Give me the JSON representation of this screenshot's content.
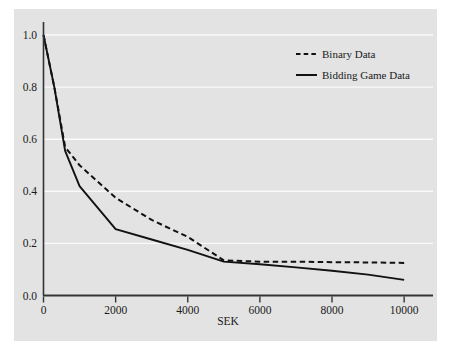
{
  "chart_data": {
    "type": "line",
    "title": "",
    "subtitle": "",
    "xlabel": "SEK",
    "ylabel": "",
    "xlim": [
      0,
      10800
    ],
    "ylim": [
      0.0,
      1.05
    ],
    "xticks": [
      0,
      2000,
      4000,
      6000,
      8000,
      10000
    ],
    "xticklabels": [
      "0",
      "2000",
      "4000",
      "6000",
      "8000",
      "10000"
    ],
    "yticks": [
      0.0,
      0.2,
      0.4,
      0.6,
      0.8,
      1.0
    ],
    "yticklabels": [
      "0.0",
      "0.2",
      "0.4",
      "0.6",
      "0.8",
      "1.0"
    ],
    "grid": "horizontal",
    "grid_color": "#fafafa",
    "panel_color": "#e3e3e3",
    "axis_color": "#333333",
    "legend_position": "top-right",
    "series": [
      {
        "name": "Binary Data",
        "style": "dashed",
        "color": "#111111",
        "x": [
          0,
          300,
          600,
          1000,
          2000,
          3000,
          4000,
          5000,
          6000,
          7000,
          8000,
          9000,
          10000
        ],
        "values": [
          1.0,
          0.8,
          0.57,
          0.5,
          0.375,
          0.29,
          0.225,
          0.135,
          0.13,
          0.13,
          0.128,
          0.127,
          0.125
        ]
      },
      {
        "name": "Bidding Game Data",
        "style": "solid",
        "color": "#111111",
        "x": [
          0,
          300,
          600,
          1000,
          2000,
          3000,
          4000,
          5000,
          6000,
          7000,
          8000,
          9000,
          10000
        ],
        "values": [
          1.0,
          0.8,
          0.555,
          0.42,
          0.255,
          0.215,
          0.175,
          0.13,
          0.12,
          0.108,
          0.095,
          0.08,
          0.06
        ]
      }
    ]
  },
  "legend": {
    "entries": [
      {
        "label": "Binary Data",
        "style": "dashed"
      },
      {
        "label": "Bidding Game Data",
        "style": "solid"
      }
    ]
  },
  "axes": {
    "x_title": "SEK"
  }
}
